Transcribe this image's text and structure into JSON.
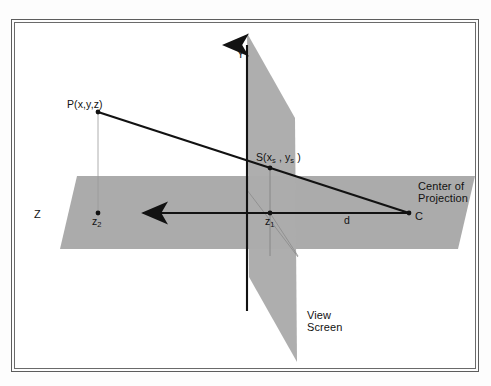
{
  "figure": {
    "background_color": "#ffffff",
    "plane_fill_color": "#ababab",
    "line_color": "#121212",
    "frame_color": "#5d5d5d"
  },
  "labels": {
    "y_axis": "Y",
    "z_axis": "Z",
    "point_p": "P(x,y,z)",
    "point_s_prefix": "S(x",
    "point_s_sub1": "s",
    "point_s_mid": " , y",
    "point_s_sub2": "s",
    "point_s_suffix": " )",
    "z_near_prefix": "z",
    "z_near_sub": "1",
    "z_far_prefix": "z",
    "z_far_sub": "2",
    "distance_d": "d",
    "center_of_projection_line1": "Center of",
    "center_of_projection_line2": "Projection",
    "center_point_c": "C",
    "view_screen_line1": "View",
    "view_screen_line2": "Screen"
  },
  "geometry": {
    "ground_plane_points": "62,153 460,153 443,226 45,226",
    "view_screen_points": "232,10 280,95 282,339 234,254",
    "y_axis": {
      "x1": 232,
      "y1": 18,
      "x2": 232,
      "y2": 288
    },
    "z_axis": {
      "x1": 394,
      "y1": 190,
      "x2": 125,
      "y2": 190
    },
    "ray_p_to_c": {
      "x1": 83,
      "y1": 89,
      "x2": 394,
      "y2": 190
    },
    "ray_s_to_c": {
      "x1": 255,
      "y1": 145,
      "x2": 394,
      "y2": 190
    },
    "point_p": {
      "x": 83,
      "y": 89
    },
    "point_s": {
      "x": 255,
      "y": 145
    },
    "point_c": {
      "x": 394,
      "y": 190
    },
    "point_z1": {
      "x": 255,
      "y": 190
    },
    "point_z2": {
      "x": 83,
      "y": 190
    },
    "dropline_p": {
      "x1": 83,
      "y1": 89,
      "x2": 83,
      "y2": 190
    },
    "dropline_s": {
      "x1": 255,
      "y1": 145,
      "x2": 255,
      "y2": 232
    },
    "diagonal_helper": {
      "x1": 255,
      "y1": 190,
      "x2": 296,
      "y2": 232
    },
    "diagonal_helper2": {
      "x1": 232,
      "y1": 167,
      "x2": 282,
      "y2": 232
    }
  },
  "label_positions": {
    "y_axis": {
      "left": 222,
      "top": 26
    },
    "z_axis": {
      "left": 20,
      "top": 186
    },
    "point_p": {
      "left": 53,
      "top": 78
    },
    "point_s": {
      "left": 243,
      "top": 131
    },
    "z_near": {
      "left": 251,
      "top": 194
    },
    "z_far": {
      "left": 78,
      "top": 194
    },
    "distance_d": {
      "left": 330,
      "top": 193
    },
    "center_of_projection": {
      "left": 404,
      "top": 159
    },
    "center_point_c": {
      "left": 401,
      "top": 189
    },
    "view_screen": {
      "left": 293,
      "top": 288
    }
  }
}
